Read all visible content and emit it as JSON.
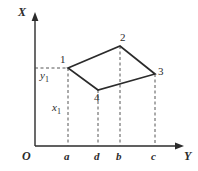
{
  "figure": {
    "background": "#ffffff",
    "line_color": "#2b2b2b",
    "dash_color": "#555555",
    "axes": {
      "vertical": {
        "name": "X",
        "label": "X",
        "x": 35,
        "y_top": 14,
        "y_bottom": 146,
        "arrow": "up"
      },
      "horizontal": {
        "name": "Y",
        "label": "Y",
        "y": 146,
        "x_left": 35,
        "x_right": 184,
        "arrow": "right"
      },
      "origin_label": "O"
    },
    "tick_labels": [
      {
        "label": "a",
        "x": 68
      },
      {
        "label": "d",
        "x": 98
      },
      {
        "label": "b",
        "x": 120
      },
      {
        "label": "c",
        "x": 155
      }
    ],
    "value_labels": [
      {
        "label": "y",
        "sub": "1",
        "x": 40,
        "y": 72
      },
      {
        "label": "x",
        "sub": "1",
        "x": 52,
        "y": 104
      }
    ],
    "vertices": [
      {
        "label": "1",
        "x": 68,
        "y": 68
      },
      {
        "label": "2",
        "x": 120,
        "y": 46
      },
      {
        "label": "3",
        "x": 155,
        "y": 74
      },
      {
        "label": "4",
        "x": 98,
        "y": 90
      }
    ],
    "polygon_points": "68,68 120,46 155,74 98,90",
    "dashed_verticals": [
      {
        "from_vertex": "1",
        "x": 68,
        "y_top": 68,
        "y_bottom": 146
      },
      {
        "from_vertex": "4",
        "x": 98,
        "y_top": 90,
        "y_bottom": 146
      },
      {
        "from_vertex": "2",
        "x": 120,
        "y_top": 46,
        "y_bottom": 146
      },
      {
        "from_vertex": "3",
        "x": 155,
        "y_top": 74,
        "y_bottom": 146
      }
    ],
    "dashed_horizontals": [
      {
        "from_vertex": "1",
        "y": 68,
        "x_left": 35,
        "x_right": 68
      }
    ]
  }
}
